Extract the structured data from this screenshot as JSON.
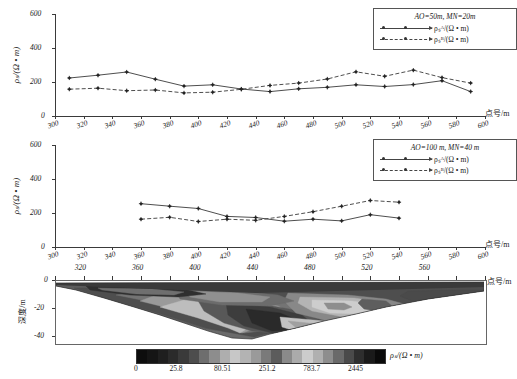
{
  "figure": {
    "xaxis_name": "点号/m",
    "yaxis_name_top": "ρₛ/(Ω • m)",
    "depth_axis_name": "深度/m",
    "colorbar_name": "ρₛ/(Ω • m)"
  },
  "chart_data": [
    {
      "type": "line",
      "panel": "top",
      "title": "AO=50m, MN=20m",
      "xlabel": "点号/m",
      "ylabel": "ρs/(Ω · m)",
      "xlim": [
        300,
        600
      ],
      "ylim": [
        0,
        600
      ],
      "xticks": [
        300,
        320,
        340,
        360,
        380,
        400,
        420,
        440,
        460,
        480,
        500,
        520,
        540,
        560,
        580,
        600
      ],
      "yticks": [
        0,
        200,
        400,
        600
      ],
      "grid": false,
      "legend_position": "top-right",
      "x": [
        310,
        330,
        350,
        370,
        390,
        410,
        430,
        450,
        470,
        490,
        510,
        530,
        550,
        570,
        590
      ],
      "series": [
        {
          "name": "ρs^A/(Ω · m)",
          "style": "solid",
          "values": [
            212,
            228,
            247,
            205,
            164,
            172,
            147,
            132,
            148,
            157,
            172,
            162,
            173,
            196,
            132
          ]
        },
        {
          "name": "ρs^B/(Ω · m)",
          "style": "dashed",
          "values": [
            146,
            152,
            137,
            141,
            124,
            128,
            145,
            168,
            182,
            206,
            248,
            222,
            258,
            214,
            182
          ]
        }
      ]
    },
    {
      "type": "line",
      "panel": "middle",
      "title": "AO=100 m, MN=40 m",
      "xlabel": "点号/m",
      "ylabel": "ρs/(Ω · m)",
      "xlim": [
        300,
        600
      ],
      "ylim": [
        0,
        600
      ],
      "xticks": [
        300,
        320,
        340,
        360,
        380,
        400,
        420,
        440,
        460,
        480,
        500,
        520,
        540,
        560,
        580,
        600
      ],
      "yticks": [
        0,
        200,
        400,
        600
      ],
      "grid": false,
      "legend_position": "top-right",
      "x": [
        360,
        380,
        400,
        420,
        440,
        460,
        480,
        500,
        520,
        540
      ],
      "series": [
        {
          "name": "ρs^A/(Ω · m)",
          "style": "solid",
          "values": [
            243,
            228,
            215,
            168,
            162,
            140,
            152,
            142,
            178,
            158
          ]
        },
        {
          "name": "ρs^B/(Ω · m)",
          "style": "dashed",
          "values": [
            152,
            163,
            138,
            152,
            145,
            168,
            196,
            228,
            262,
            252
          ]
        }
      ]
    },
    {
      "type": "heatmap",
      "panel": "bottom",
      "title": "",
      "xlabel": "点号/m",
      "ylabel": "深度/m",
      "xlim": [
        300,
        600
      ],
      "ylim": [
        -45,
        0
      ],
      "xticks": [
        320,
        360,
        400,
        440,
        480,
        520,
        560
      ],
      "yticks": [
        0,
        -20,
        -40
      ],
      "colorbar": {
        "label": "ρs/(Ω · m)",
        "ticks": [
          "0",
          "25.8",
          "80.51",
          "251.2",
          "783.7",
          "2445"
        ],
        "bands": [
          "#0d0d0d",
          "#151515",
          "#1f1f1f",
          "#2b2b2b",
          "#3a3a3a",
          "#4d4d4d",
          "#6e6e6e",
          "#8d8d8d",
          "#aeaeae",
          "#c7c7c7",
          "#b3b3b3",
          "#9a9a9a",
          "#7a7a7a",
          "#5c5c5c",
          "#8a8a8a",
          "#ababab",
          "#cccccc",
          "#b0b0b0",
          "#8e8e8e",
          "#6a6a6a",
          "#4a4a4a",
          "#2e2e2e",
          "#1a1a1a",
          "#0a0a0a"
        ]
      }
    }
  ],
  "top_chart": {
    "legend": {
      "title": "AO=50m, MN=20m",
      "entry1": "ρₛᴬ/(Ω • m)",
      "entry2": "ρₛᴮ/(Ω • m)"
    },
    "yticks": [
      "600",
      "400",
      "200",
      "0"
    ],
    "xticks": [
      "300",
      "320",
      "340",
      "360",
      "380",
      "400",
      "420",
      "440",
      "460",
      "480",
      "500",
      "520",
      "540",
      "560",
      "580",
      "600"
    ],
    "ylabel": "ρₛ/(Ω • m)",
    "xlabel": "点号/m"
  },
  "mid_chart": {
    "legend": {
      "title": "AO=100 m, MN=40 m",
      "entry1": "ρₛᴬ/(Ω • m)",
      "entry2": "ρₛᴮ/(Ω • m)"
    },
    "yticks": [
      "600",
      "400",
      "200",
      "0"
    ],
    "xticks": [
      "300",
      "320",
      "340",
      "360",
      "380",
      "400",
      "420",
      "440",
      "460",
      "480",
      "500",
      "520",
      "540",
      "560",
      "580",
      "600"
    ],
    "ylabel": "ρₛ/(Ω • m)",
    "xlabel": "点号/m"
  },
  "section": {
    "xticks": [
      "320",
      "360",
      "400",
      "440",
      "480",
      "520",
      "560"
    ],
    "yticks": [
      "0",
      "-20",
      "-40"
    ],
    "ylabel": "深度/m",
    "xlabel": "点号/m",
    "cbar_ticks": [
      "0",
      "25.8",
      "80.51",
      "251.2",
      "783.7",
      "2445"
    ],
    "cbar_label": "ρₛ/(Ω • m)"
  }
}
